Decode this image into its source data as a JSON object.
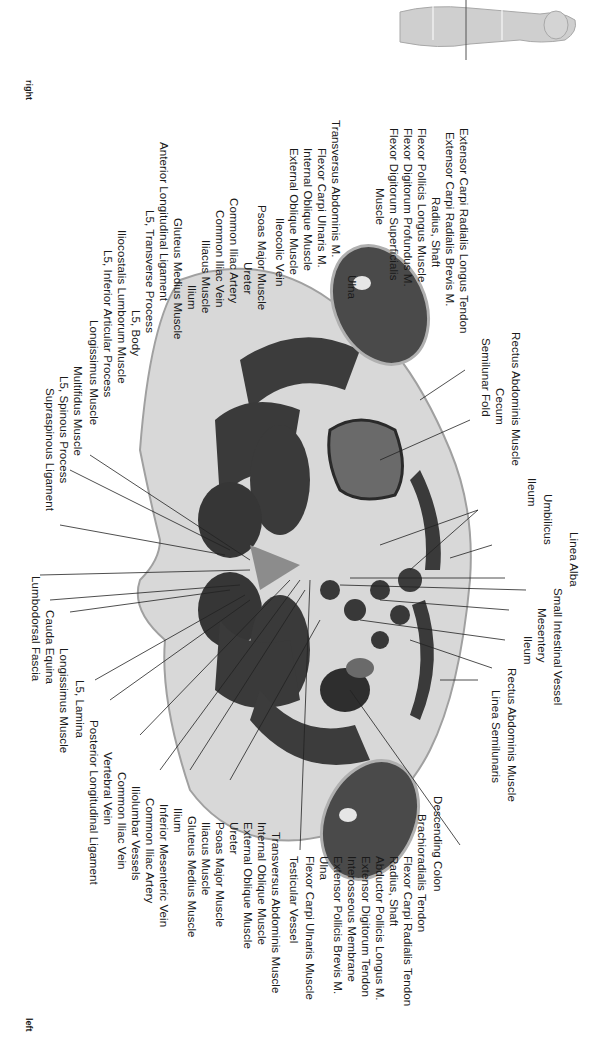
{
  "figure": {
    "orientation": {
      "top": "right",
      "bottom": "left"
    },
    "thumbnail": "body-silhouette-with-section-line",
    "labels_left_upper": [
      "Extensor Carpi Radialis Longus Tendon",
      "Extensor Carpi Radialis Brevis M.",
      "Radius, Shaft",
      "Flexor Pollicis Longus Muscle",
      "Flexor Digitorum Profundus M.",
      "Flexor Digitorum Superficialis",
      "Muscle",
      "Ulna",
      "Transversus Abdominis M.",
      "Flexor Carpi Ulnaris M.",
      "Internal Oblique Muscle",
      "External Oblique Muscle",
      "Ileocolic Vein",
      "Psoas Major Muscle",
      "Ureter",
      "Common Iliac Artery",
      "Common Iliac Vein",
      "Iliacus Muscle",
      "Ilium",
      "Gluteus Medius Muscle",
      "Anterior Longitudinal Ligament",
      "L5, Transverse Process",
      "L5, Body",
      "Iliocostalis Lumborum Muscle",
      "L5, Inferior Articular Process",
      "Longissimus Muscle",
      "Multifidus Muscle",
      "L5, Spinous Process",
      "Supraspinous Ligament"
    ],
    "labels_left_lower": [
      "Lumbodorsal Fascia",
      "Cauda Equina",
      "Longissimus Muscle",
      "L5, Lamina",
      "Posterior Longitudinal Ligament",
      "Vertebral Vein",
      "Common Iliac Vein",
      "Iliolumbar Vessels",
      "Common Iliac Artery",
      "Inferior Mesenteric Vein",
      "Ilium",
      "Gluteus Medius Muscle",
      "Iliacus Muscle",
      "Psoas Major Muscle",
      "Ureter",
      "External Oblique Muscle",
      "Internal Oblique Muscle",
      "Transversus Abdominis Muscle",
      "Testicular Vessel",
      "Flexor Carpi Ulnaris Muscle",
      "Ulna",
      "Extensor Pollicis Brevis M.",
      "Interosseous Membrane",
      "Extensor Digitorum Tendon",
      "Abductor Pollicis Longus M.",
      "Radius, Shaft",
      "Flexor Carpi Radialis Tendon",
      "Brachioradialis Tendon",
      "Descending Colon"
    ],
    "labels_right": [
      "Semilunar Fold",
      "Rectus Abdominis Muscle",
      "Cecum",
      "Ileum",
      "Umbilicus",
      "Linea Alba",
      "Small Intestinal Vessel",
      "Mesentery",
      "Ileum",
      "Rectus Abdominis Muscle",
      "Linea Semilunaris"
    ],
    "colors": {
      "muscle": "#3a3a3a",
      "fat": "#d9d9d9",
      "skin": "#bdbdbd",
      "bowel_fluid": "#6a6a6a",
      "bone": "#eeeeee",
      "leader_line": "#222222"
    }
  }
}
